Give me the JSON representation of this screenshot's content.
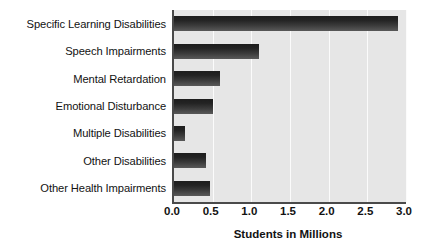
{
  "chart_data": {
    "type": "bar",
    "orientation": "horizontal",
    "title": "",
    "xlabel": "Students in Millions",
    "ylabel": "",
    "categories": [
      "Specific Learning Disabilities",
      "Speech Impairments",
      "Mental Retardation",
      "Emotional Disturbance",
      "Multiple Disabilities",
      "Other Disabilities",
      "Other Health Impairments"
    ],
    "values": [
      2.9,
      1.1,
      0.59,
      0.5,
      0.14,
      0.42,
      0.47
    ],
    "xlim": [
      0.0,
      3.0
    ],
    "xticks": [
      0.0,
      0.5,
      1.0,
      1.5,
      2.0,
      2.5,
      3.0
    ],
    "xtick_labels": [
      "0.0",
      "0.5",
      "1.0",
      "1.5",
      "2.0",
      "2.5",
      "3.0"
    ],
    "grid": true,
    "grid_axis": "x",
    "legend": false,
    "colors": {
      "bar_dark": "#1d1d1d",
      "bar_light": "#585858",
      "plot_background": "#e6e6e6",
      "gridline": "#fbfbfb",
      "axis_line": "#4a4a4a",
      "text": "#121212",
      "page_background": "#ffffff"
    }
  }
}
